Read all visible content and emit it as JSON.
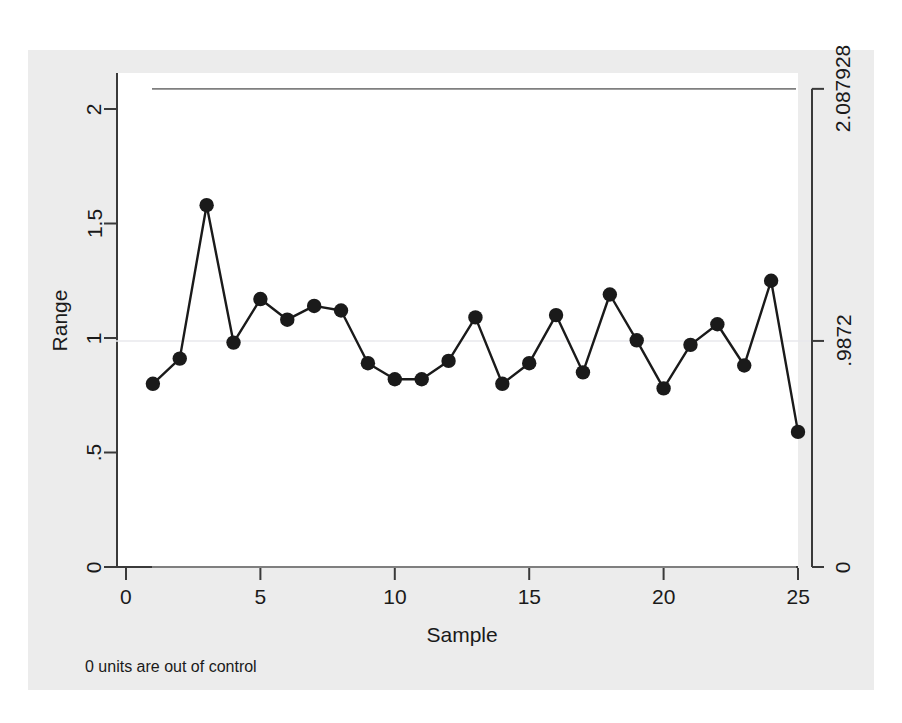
{
  "chart_data": {
    "type": "line",
    "title": "",
    "subtitle": "",
    "xlabel": "Sample",
    "ylabel": "Range",
    "xlim": [
      0,
      25.8
    ],
    "ylim": [
      0,
      2.17
    ],
    "xticks": [
      "0",
      "5",
      "10",
      "15",
      "20",
      "25"
    ],
    "xtick_values": [
      0,
      5,
      10,
      15,
      20,
      25
    ],
    "yticks": [
      "0",
      ".5",
      "1",
      "1.5",
      "2"
    ],
    "ytick_values": [
      0,
      0.5,
      1,
      1.5,
      2
    ],
    "grid": "center-line-only",
    "legend": "none",
    "x": [
      1,
      2,
      3,
      4,
      5,
      6,
      7,
      8,
      9,
      10,
      11,
      12,
      13,
      14,
      15,
      16,
      17,
      18,
      19,
      20,
      21,
      22,
      23,
      24,
      25
    ],
    "series": [
      {
        "name": "Range",
        "marker": "filled-circle",
        "color": "#1a1a1a",
        "values": [
          0.8,
          0.91,
          1.58,
          0.98,
          1.17,
          1.08,
          1.14,
          1.12,
          0.89,
          0.82,
          0.82,
          0.9,
          1.09,
          0.8,
          0.89,
          1.1,
          0.85,
          1.19,
          0.99,
          0.78,
          0.97,
          1.06,
          0.88,
          1.25,
          0.59
        ]
      }
    ],
    "control_limits": [
      {
        "name": "UCL",
        "label": "2.087928",
        "value": 2.087928,
        "color": "#7f7f7f"
      },
      {
        "name": "CL",
        "label": ".9872",
        "value": 0.9872,
        "color": "#7f7f7f"
      },
      {
        "name": "LCL",
        "label": "0",
        "value": 0,
        "color": "#7f7f7f"
      }
    ],
    "annotations": [
      {
        "name": "out-of-control-note",
        "text": "0 units are out of control"
      }
    ]
  },
  "axes": {
    "y_title": "Range",
    "x_title": "Sample"
  },
  "note": {
    "text": "0 units are out of control"
  },
  "colors": {
    "graph_region": "#ececec",
    "plot_background": "#ffffff",
    "axis": "#3a3a3a",
    "marker": "#1a1a1a",
    "limit_line": "#7f7f7f",
    "gridline": "#e8e8ec"
  }
}
